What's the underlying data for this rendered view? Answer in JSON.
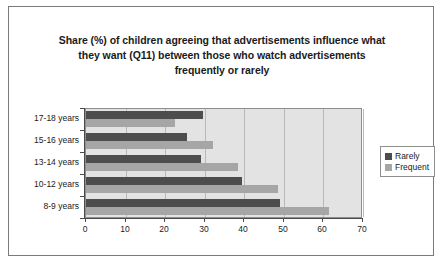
{
  "chart_data": {
    "type": "bar",
    "orientation": "horizontal",
    "title": "Share (%) of children agreeing that advertisements influence what they want (Q11) between those who watch advertisements frequently or rarely",
    "title_lines": [
      "Share (%) of children agreeing that advertisements influence what",
      "they want (Q11) between those who watch advertisements",
      "frequently or rarely"
    ],
    "categories": [
      "17-18 years",
      "15-16 years",
      "13-14 years",
      "10-12 years",
      "8-9 years"
    ],
    "series": [
      {
        "name": "Rarely",
        "color": "#4d4d4d",
        "values": [
          29.5,
          25.5,
          29,
          39.5,
          49
        ]
      },
      {
        "name": "Frequent",
        "color": "#a6a6a6",
        "values": [
          22.5,
          32,
          38.5,
          48.5,
          61.5
        ]
      }
    ],
    "xlabel": "",
    "ylabel": "",
    "xlim": [
      0,
      70
    ],
    "xticks": [
      0,
      10,
      20,
      30,
      40,
      50,
      60,
      70
    ],
    "xtick_labels": [
      "0",
      "10",
      "20",
      "30",
      "40",
      "50",
      "60",
      "70"
    ],
    "grid": "vertical",
    "legend_position": "right",
    "legend_entries": [
      "Rarely",
      "Frequent"
    ],
    "plot_background": "#e3e3e3"
  }
}
